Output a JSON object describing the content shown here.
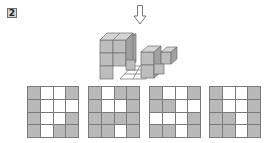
{
  "question": {
    "number": "2"
  },
  "view_direction": {
    "icon": "down-arrow-icon",
    "meaning": "top view"
  },
  "options": [
    {
      "rows": [
        [
          "G",
          "W",
          "W",
          "G"
        ],
        [
          "G",
          "W",
          "W",
          "W"
        ],
        [
          "G",
          "W",
          "W",
          "G"
        ],
        [
          "G",
          "W",
          "G",
          "G"
        ]
      ]
    },
    {
      "rows": [
        [
          "G",
          "W",
          "G",
          "G"
        ],
        [
          "G",
          "W",
          "W",
          "G"
        ],
        [
          "G",
          "G",
          "G",
          "G"
        ],
        [
          "G",
          "G",
          "W",
          "G"
        ]
      ]
    },
    {
      "rows": [
        [
          "G",
          "W",
          "W",
          "G"
        ],
        [
          "G",
          "G",
          "W",
          "W"
        ],
        [
          "W",
          "W",
          "W",
          "G"
        ],
        [
          "G",
          "G",
          "W",
          "G"
        ]
      ]
    },
    {
      "rows": [
        [
          "G",
          "W",
          "W",
          "G"
        ],
        [
          "G",
          "W",
          "W",
          "G"
        ],
        [
          "G",
          "G",
          "W",
          "G"
        ],
        [
          "G",
          "G",
          "W",
          "G"
        ]
      ]
    }
  ],
  "colors": {
    "shaded": "#b9b9b9",
    "empty": "#ffffff",
    "line": "#7a7a7a"
  }
}
